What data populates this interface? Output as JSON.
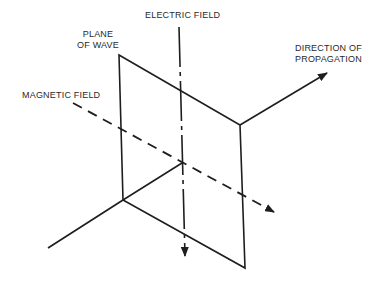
{
  "diagram": {
    "type": "electromagnetic-wave-propagation",
    "colors": {
      "stroke": "#1e1e1e",
      "text": "#2a2a2a",
      "background": "#ffffff"
    },
    "labels": {
      "electric_field": "ELECTRIC FIELD",
      "plane_of_wave_line1": "PLANE",
      "plane_of_wave_line2": "OF WAVE",
      "magnetic_field": "MAGNETIC FIELD",
      "direction_line1": "DIRECTION OF",
      "direction_line2": "PROPAGATION"
    },
    "elements": [
      {
        "id": "plane-of-wave",
        "shape": "parallelogram",
        "corners": [
          [
            119,
            55
          ],
          [
            240,
            125
          ],
          [
            245,
            268
          ],
          [
            123,
            200
          ]
        ]
      },
      {
        "id": "electric-field-axis",
        "style": "dash-dot",
        "from": [
          179,
          27
        ],
        "to": [
          185,
          258
        ],
        "arrow": "end"
      },
      {
        "id": "magnetic-field-axis",
        "style": "dashed",
        "from": [
          73,
          103
        ],
        "to": [
          275,
          213
        ],
        "arrow": "end"
      },
      {
        "id": "propagation-axis",
        "style": "solid",
        "from": [
          48,
          248
        ],
        "to": [
          327,
          85
        ],
        "arrow": "end"
      }
    ]
  }
}
